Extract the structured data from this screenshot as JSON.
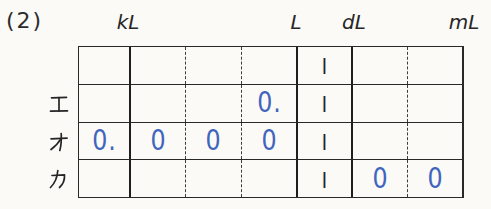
{
  "problem_number": "(2)",
  "unit_labels": [
    "kL",
    "L",
    "dL",
    "mL"
  ],
  "row_labels": [
    "エ",
    "オ",
    "カ"
  ],
  "table": {
    "rows": [
      {
        "cells": [
          "",
          "",
          "",
          "",
          "|",
          "",
          ""
        ]
      },
      {
        "cells": [
          "",
          "",
          "",
          "0.",
          "|",
          "",
          ""
        ]
      },
      {
        "cells": [
          "0.",
          "0",
          "0",
          "0",
          "|",
          "",
          ""
        ]
      },
      {
        "cells": [
          "",
          "",
          "",
          "",
          "|",
          "0",
          "0"
        ]
      }
    ]
  },
  "colors": {
    "ink": "#2a2a2a",
    "answer_blue": "#4165bd",
    "paper": "#fbfaf7"
  }
}
